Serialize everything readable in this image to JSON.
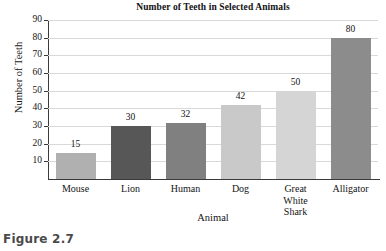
{
  "figure": {
    "caption": "Figure 2.7"
  },
  "chart_data": {
    "type": "bar",
    "title": "Number of Teeth in Selected Animals",
    "xlabel": "Animal",
    "ylabel": "Number of Teeth",
    "categories": [
      "Mouse",
      "Lion",
      "Human",
      "Dog",
      "Great White Shark",
      "Alligator"
    ],
    "category_lines": [
      [
        "Mouse"
      ],
      [
        "Lion"
      ],
      [
        "Human"
      ],
      [
        "Dog"
      ],
      [
        "Great",
        "White",
        "Shark"
      ],
      [
        "Alligator"
      ]
    ],
    "values": [
      15,
      30,
      32,
      42,
      50,
      80
    ],
    "value_labels": [
      "15",
      "30",
      "32",
      "42",
      "50",
      "80"
    ],
    "bar_colors": [
      "#b0b0b0",
      "#575757",
      "#808080",
      "#c9c9c9",
      "#d5d5d5",
      "#8c8c8c"
    ],
    "ylim": [
      0,
      90
    ],
    "ytick_values": [
      10,
      20,
      30,
      40,
      50,
      60,
      70,
      80,
      90
    ],
    "ytick_labels": [
      "10",
      "20",
      "30",
      "40",
      "50",
      "60",
      "70",
      "80",
      "90"
    ],
    "grid": true,
    "grid_color": "#d9d9d9",
    "axis_color": "#3a3a3a",
    "legend": false
  }
}
